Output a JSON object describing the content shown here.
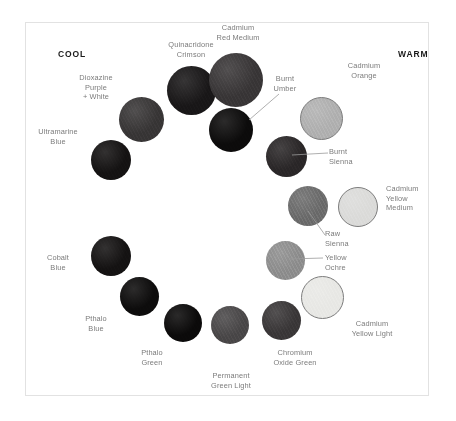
{
  "diagram": {
    "poles": {
      "cool_label": "COOL",
      "warm_label": "WARM"
    },
    "panel": {
      "background": "#ffffff",
      "border_color": "#e2e2e2"
    },
    "caption_color": "#7b7b7b",
    "leader_color": "#9a9a9a"
  },
  "chart_data": {
    "type": "scatter",
    "xlabel": "",
    "ylabel": "",
    "note": "Pigment swatches arranged in a horseshoe from cool (left) to warm (right)",
    "swatches": [
      {
        "name": "Quinacridone Crimson",
        "label": "Quinacridone\nCrimson",
        "color": "#191718",
        "cx": 190,
        "cy": 89,
        "d": 49,
        "label_x": 150,
        "label_y": 39,
        "label_w": 80,
        "label_align": "center",
        "leader": null,
        "stroke": false
      },
      {
        "name": "Cadmium Red Medium",
        "label": "Cadmium\nRed Medium",
        "color": "#3a3738",
        "cx": 235,
        "cy": 79,
        "d": 54,
        "label_x": 195,
        "label_y": 22,
        "label_w": 84,
        "label_align": "center",
        "leader": null,
        "stroke": false
      },
      {
        "name": "Dioxazine Purple + White",
        "label": "Dioxazine\nPurple\n+ White",
        "color": "#393637",
        "cx": 140,
        "cy": 118,
        "d": 45,
        "label_x": 64,
        "label_y": 72,
        "label_w": 62,
        "label_align": "center",
        "leader": null,
        "stroke": false
      },
      {
        "name": "Ultramarine Blue",
        "label": "Ultramarine\nBlue",
        "color": "#151313",
        "cx": 110,
        "cy": 159,
        "d": 40,
        "label_x": 26,
        "label_y": 126,
        "label_w": 62,
        "label_align": "center",
        "leader": null,
        "stroke": false
      },
      {
        "name": "Burnt Umber",
        "label": "Burnt\nUmber",
        "color": "#0c0b0b",
        "cx": 230,
        "cy": 129,
        "d": 44,
        "label_x": 262,
        "label_y": 73,
        "label_w": 44,
        "label_align": "center",
        "leader": {
          "x1": 248,
          "y1": 119,
          "x2": 278,
          "y2": 93
        },
        "stroke": false
      },
      {
        "name": "Cadmium Orange",
        "label": "Cadmium\nOrange",
        "color": "#b2b2b2",
        "cx": 320,
        "cy": 117,
        "d": 43,
        "label_x": 330,
        "label_y": 60,
        "label_w": 66,
        "label_align": "center",
        "leader": null,
        "stroke": true
      },
      {
        "name": "Burnt Sienna",
        "label": "Burnt\nSienna",
        "color": "#2b2829",
        "cx": 285,
        "cy": 155,
        "d": 41,
        "label_x": 328,
        "label_y": 146,
        "label_w": 42,
        "label_align": "left",
        "leader": {
          "x1": 291,
          "y1": 154,
          "x2": 327,
          "y2": 152
        },
        "stroke": false
      },
      {
        "name": "Raw Sienna",
        "label": "Raw\nSienna",
        "color": "#6e6e6e",
        "cx": 307,
        "cy": 205,
        "d": 40,
        "label_x": 324,
        "label_y": 228,
        "label_w": 42,
        "label_align": "left",
        "leader": {
          "x1": 307,
          "y1": 210,
          "x2": 324,
          "y2": 234
        },
        "stroke": false
      },
      {
        "name": "Cadmium Yellow Medium",
        "label": "Cadmium\nYellow\nMedium",
        "color": "#dcdcda",
        "cx": 357,
        "cy": 206,
        "d": 40,
        "label_x": 385,
        "label_y": 183,
        "label_w": 62,
        "label_align": "left",
        "leader": null,
        "stroke": true
      },
      {
        "name": "Yellow Ochre",
        "label": "Yellow\nOchre",
        "color": "#909090",
        "cx": 284,
        "cy": 259,
        "d": 39,
        "label_x": 324,
        "label_y": 252,
        "label_w": 42,
        "label_align": "left",
        "leader": {
          "x1": 288,
          "y1": 258,
          "x2": 322,
          "y2": 257
        },
        "stroke": false
      },
      {
        "name": "Cadmium Yellow Light",
        "label": "Cadmium\nYellow Light",
        "color": "#e9e9e6",
        "cx": 321,
        "cy": 296,
        "d": 43,
        "label_x": 335,
        "label_y": 318,
        "label_w": 72,
        "label_align": "center",
        "leader": null,
        "stroke": true
      },
      {
        "name": "Cobalt Blue",
        "label": "Cobalt\nBlue",
        "color": "#151313",
        "cx": 110,
        "cy": 255,
        "d": 40,
        "label_x": 34,
        "label_y": 252,
        "label_w": 46,
        "label_align": "center",
        "leader": null,
        "stroke": false
      },
      {
        "name": "Pthalo Blue",
        "label": "Pthalo\nBlue",
        "color": "#0d0c0c",
        "cx": 138,
        "cy": 295,
        "d": 39,
        "label_x": 72,
        "label_y": 313,
        "label_w": 46,
        "label_align": "center",
        "leader": null,
        "stroke": false
      },
      {
        "name": "Pthalo Green",
        "label": "Pthalo\nGreen",
        "color": "#0b0a0a",
        "cx": 182,
        "cy": 322,
        "d": 38,
        "label_x": 128,
        "label_y": 347,
        "label_w": 46,
        "label_align": "center",
        "leader": null,
        "stroke": false
      },
      {
        "name": "Permanent Green Light",
        "label": "Permanent\nGreen Light",
        "color": "#4b4849",
        "cx": 229,
        "cy": 324,
        "d": 38,
        "label_x": 194,
        "label_y": 370,
        "label_w": 72,
        "label_align": "center",
        "leader": null,
        "stroke": false
      },
      {
        "name": "Chromium Oxide Green",
        "label": "Chromium\nOxide Green",
        "color": "#3b3839",
        "cx": 280,
        "cy": 319,
        "d": 39,
        "label_x": 256,
        "label_y": 347,
        "label_w": 76,
        "label_align": "center",
        "leader": null,
        "stroke": false
      }
    ]
  }
}
